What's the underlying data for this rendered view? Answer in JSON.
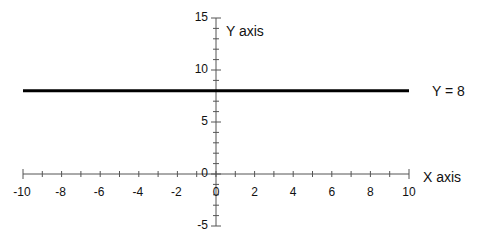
{
  "chart_data": {
    "type": "line",
    "title": "",
    "xlabel": "X axis",
    "ylabel": "Y axis",
    "xlim": [
      -10,
      10
    ],
    "ylim": [
      -5,
      15
    ],
    "grid": false,
    "x_ticks": [
      "-10",
      "-8",
      "-6",
      "-4",
      "-2",
      "0",
      "2",
      "4",
      "6",
      "8",
      "10"
    ],
    "y_ticks": [
      "-5",
      "0",
      "5",
      "10",
      "15"
    ],
    "series": [
      {
        "name": "Y = 8",
        "x": [
          -10,
          10
        ],
        "y": [
          8,
          8
        ],
        "color": "#000000",
        "line_width": 3
      }
    ],
    "annotations": [
      {
        "text": "Y = 8",
        "x": 10,
        "y": 8,
        "position": "right of line end"
      }
    ]
  },
  "labels": {
    "x_axis": "X axis",
    "y_axis": "Y axis",
    "line_label": "Y = 8"
  },
  "colors": {
    "axis": "#555555",
    "line": "#000000",
    "text": "#111111"
  }
}
